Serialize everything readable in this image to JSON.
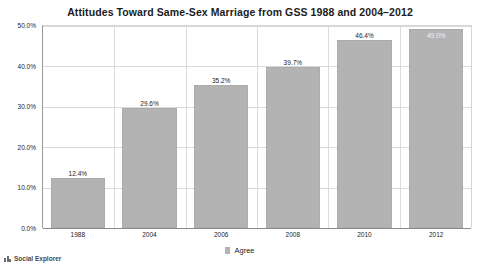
{
  "chart_data": {
    "type": "bar",
    "title": "Attitudes Toward Same-Sex Marriage from GSS 1988 and 2004–2012",
    "categories": [
      "1988",
      "2004",
      "2006",
      "2008",
      "2010",
      "2012"
    ],
    "values": [
      12.4,
      29.6,
      35.2,
      39.7,
      46.4,
      49.0
    ],
    "value_labels": [
      "12.4%",
      "29.6%",
      "35.2%",
      "39.7%",
      "46.4%",
      "49.0%"
    ],
    "series": [
      {
        "name": "Agree",
        "values": [
          12.4,
          29.6,
          35.2,
          39.7,
          46.4,
          49.0
        ],
        "color": "#b3b3b3"
      }
    ],
    "xlabel": "",
    "ylabel": "",
    "ylim": [
      0,
      50
    ],
    "ytick_values": [
      0,
      10,
      20,
      30,
      40,
      50
    ],
    "ytick_labels": [
      "0.0%",
      "10.0%",
      "20.0%",
      "30.0%",
      "40.0%",
      "50.0%"
    ],
    "grid": true,
    "legend_position": "bottom",
    "label_inside_bar": [
      false,
      false,
      false,
      false,
      false,
      true
    ]
  },
  "legend": {
    "items": [
      {
        "label": "Agree",
        "color": "#b3b3b3"
      }
    ]
  },
  "attribution": {
    "text": "Social Explorer",
    "logo_name": "social-explorer-logo"
  },
  "colors": {
    "bar": "#b3b3b3",
    "bar_border": "#ababab",
    "gridline": "#d9d9d9",
    "axis": "#8c8c8c",
    "text": "#1c1c1c"
  }
}
